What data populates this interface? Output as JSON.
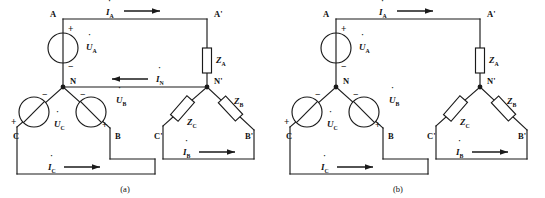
{
  "figure": {
    "kind": "three-phase-circuit-diagram-pair",
    "background": "#ffffff",
    "line_color": "#1a1a1a"
  },
  "panels": [
    {
      "id": "a",
      "caption": "(a)",
      "description": "Three-phase four-wire Y-Y connected circuit with neutral line N-N'",
      "has_neutral_line": true,
      "source_nodes": {
        "a": "A",
        "b": "B",
        "c": "C",
        "neutral": "N"
      },
      "load_nodes": {
        "a": "A'",
        "b": "B'",
        "c": "C'",
        "neutral": "N'"
      },
      "sources": [
        {
          "name": "source-ua",
          "label": "U",
          "sub": "A",
          "dot": true,
          "plus": "+",
          "minus": "−"
        },
        {
          "name": "source-ub",
          "label": "U",
          "sub": "B",
          "dot": true,
          "plus": "+",
          "minus": "−"
        },
        {
          "name": "source-uc",
          "label": "U",
          "sub": "C",
          "dot": true,
          "plus": "+",
          "minus": "−"
        }
      ],
      "impedances": [
        {
          "name": "impedance-za",
          "label": "Z",
          "sub": "A"
        },
        {
          "name": "impedance-zb",
          "label": "Z",
          "sub": "B"
        },
        {
          "name": "impedance-zc",
          "label": "Z",
          "sub": "C"
        }
      ],
      "currents": [
        {
          "name": "current-ia",
          "label": "I",
          "sub": "A",
          "dot": true,
          "direction": "right"
        },
        {
          "name": "current-in",
          "label": "I",
          "sub": "N",
          "dot": true,
          "direction": "left"
        },
        {
          "name": "current-ib",
          "label": "I",
          "sub": "B",
          "dot": true,
          "direction": "right"
        },
        {
          "name": "current-ic",
          "label": "I",
          "sub": "C",
          "dot": true,
          "direction": "right"
        }
      ]
    },
    {
      "id": "b",
      "caption": "(b)",
      "description": "Three-phase three-wire Y-Y connected circuit without neutral line",
      "has_neutral_line": false,
      "source_nodes": {
        "a": "A",
        "b": "B",
        "c": "C",
        "neutral": "N"
      },
      "load_nodes": {
        "a": "A'",
        "b": "B'",
        "c": "C'",
        "neutral": "N'"
      },
      "sources": [
        {
          "name": "source-ua",
          "label": "U",
          "sub": "A",
          "dot": true,
          "plus": "+",
          "minus": "−"
        },
        {
          "name": "source-ub",
          "label": "U",
          "sub": "B",
          "dot": true,
          "plus": "+",
          "minus": "−"
        },
        {
          "name": "source-uc",
          "label": "U",
          "sub": "C",
          "dot": true,
          "plus": "+",
          "minus": "−"
        }
      ],
      "impedances": [
        {
          "name": "impedance-za",
          "label": "Z",
          "sub": "A"
        },
        {
          "name": "impedance-zb",
          "label": "Z",
          "sub": "B"
        },
        {
          "name": "impedance-zc",
          "label": "Z",
          "sub": "C"
        }
      ],
      "currents": [
        {
          "name": "current-ia",
          "label": "I",
          "sub": "A",
          "dot": true,
          "direction": "right"
        },
        {
          "name": "current-ib",
          "label": "I",
          "sub": "B",
          "dot": true,
          "direction": "right"
        },
        {
          "name": "current-ic",
          "label": "I",
          "sub": "C",
          "dot": true,
          "direction": "right"
        }
      ]
    }
  ]
}
